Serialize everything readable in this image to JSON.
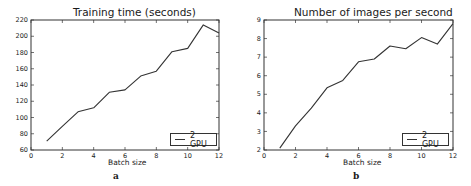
{
  "chart_data": [
    {
      "type": "line",
      "title": "Training time (seconds)",
      "xlabel": "Batch size",
      "ylabel": "",
      "caption": "a",
      "xlim": [
        0,
        12
      ],
      "ylim": [
        60,
        220
      ],
      "xticks": [
        0,
        2,
        4,
        6,
        8,
        10,
        12
      ],
      "yticks": [
        60,
        80,
        100,
        120,
        140,
        160,
        180,
        200,
        220
      ],
      "grid": false,
      "legend_position": "lower right",
      "series": [
        {
          "name": "2 GPU",
          "x": [
            1,
            2,
            3,
            4,
            5,
            6,
            7,
            8,
            9,
            10,
            11,
            12
          ],
          "values": [
            71,
            89,
            107,
            112,
            131,
            134,
            151,
            157,
            181,
            185,
            214,
            204
          ]
        }
      ]
    },
    {
      "type": "line",
      "title": "Number of images per second",
      "xlabel": "Batch size",
      "ylabel": "",
      "caption": "b",
      "xlim": [
        0,
        12
      ],
      "ylim": [
        2,
        9
      ],
      "xticks": [
        0,
        2,
        4,
        6,
        8,
        10,
        12
      ],
      "yticks": [
        2,
        3,
        4,
        5,
        6,
        7,
        8,
        9
      ],
      "grid": false,
      "legend_position": "lower right",
      "series": [
        {
          "name": "2 GPU",
          "x": [
            1,
            2,
            3,
            4,
            5,
            6,
            7,
            8,
            9,
            10,
            11,
            12
          ],
          "values": [
            2.1,
            3.3,
            4.25,
            5.35,
            5.75,
            6.75,
            6.9,
            7.6,
            7.45,
            8.05,
            7.7,
            8.8
          ]
        }
      ]
    }
  ],
  "colors": {
    "line": "#333333",
    "axis": "#333333"
  }
}
